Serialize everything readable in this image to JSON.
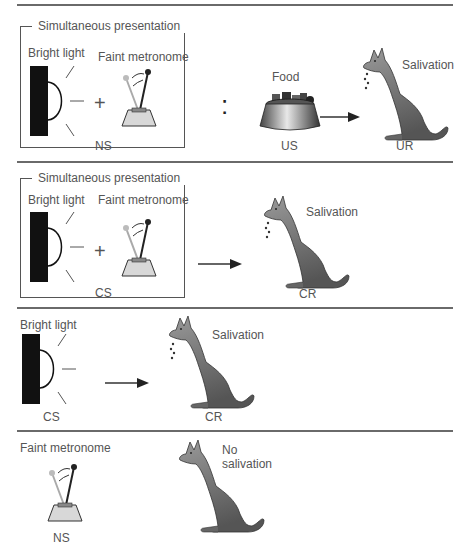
{
  "panels": [
    {
      "id": "before_conditioning",
      "bracket_title": "Simultaneous presentation",
      "stimulus_1": "Bright light",
      "stimulus_2": "Faint metronome",
      "operator": "+",
      "compound_label": "NS",
      "separator": ":",
      "food_label": "Food",
      "food_tag": "US",
      "response": "Salivation",
      "response_tag": "UR"
    },
    {
      "id": "after_conditioning_compound",
      "bracket_title": "Simultaneous presentation",
      "stimulus_1": "Bright light",
      "stimulus_2": "Faint metronome",
      "operator": "+",
      "compound_label": "CS",
      "response": "Salivation",
      "response_tag": "CR"
    },
    {
      "id": "test_light",
      "stimulus": "Bright light",
      "stimulus_tag": "CS",
      "response": "Salivation",
      "response_tag": "CR"
    },
    {
      "id": "test_metronome",
      "stimulus": "Faint metronome",
      "stimulus_tag": "NS",
      "response": "No salivation"
    }
  ],
  "colors": {
    "rule": "#6a6a6a",
    "text": "#555555",
    "light_block": "#111111",
    "dog_body": "#7c7c7c",
    "metronome_base": "#cfcfcf"
  }
}
